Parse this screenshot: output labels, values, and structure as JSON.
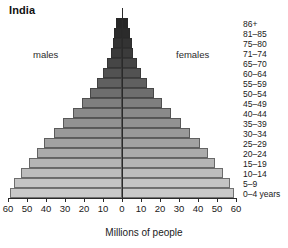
{
  "chart_data": {
    "type": "bar",
    "title": "India",
    "subtitle": "",
    "xlabel": "Millions of people",
    "ylabel": "",
    "orientation": "population-pyramid",
    "xlim": [
      -60,
      60
    ],
    "xticks": [
      60,
      50,
      40,
      30,
      20,
      10,
      0,
      10,
      20,
      30,
      40,
      50,
      60
    ],
    "xtick_labels": [
      "60",
      "50",
      "40",
      "30",
      "20",
      "10",
      "0",
      "10",
      "20",
      "30",
      "40",
      "50",
      "60"
    ],
    "grid": false,
    "legend_position": "inline",
    "series": [
      {
        "name": "males",
        "side": "left",
        "values": [
          59,
          57,
          53,
          49,
          45,
          41,
          36,
          31,
          26,
          21,
          17,
          13,
          10,
          8,
          6,
          5,
          4,
          3
        ]
      },
      {
        "name": "females",
        "side": "right",
        "values": [
          59,
          57,
          53,
          49,
          45,
          41,
          36,
          31,
          26,
          21,
          17,
          13,
          10,
          8,
          6,
          5,
          4,
          3
        ]
      }
    ],
    "categories": [
      "0–4 years",
      "5–9",
      "10–14",
      "15–19",
      "20–24",
      "25–29",
      "30–34",
      "35–39",
      "40–44",
      "45–49",
      "50–54",
      "55–59",
      "60–64",
      "65–70",
      "71–74",
      "75–80",
      "81–85",
      "86+"
    ],
    "bar_colors": [
      "#c9c9c9",
      "#c4c4c4",
      "#bdbdbd",
      "#b5b5b5",
      "#ababab",
      "#a2a2a2",
      "#999999",
      "#929292",
      "#8a8a8a",
      "#7f7f7f",
      "#6e6e6e",
      "#606060",
      "#525252",
      "#464646",
      "#3b3b3b",
      "#333333",
      "#2b2b2b",
      "#262626"
    ]
  },
  "annotations": {
    "males_label": "males",
    "females_label": "females"
  },
  "colors": {
    "axis": "#2a2a2a",
    "text": "#1a1a1a",
    "background": "#ffffff"
  }
}
